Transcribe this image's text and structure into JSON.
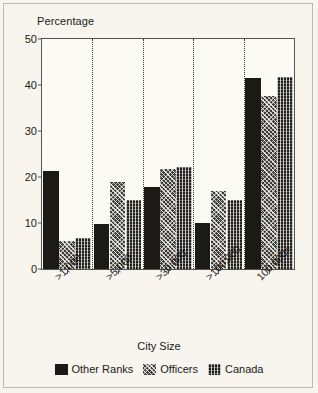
{
  "chart_data": {
    "type": "bar",
    "title": "",
    "ylabel": "Percentage",
    "xlabel": "City Size",
    "categories": [
      ">1,000",
      ">5,000",
      ">30,000",
      ">100,000",
      "100,000+"
    ],
    "series": [
      {
        "name": "Other Ranks",
        "values": [
          21.2,
          9.8,
          17.8,
          10.0,
          41.5
        ],
        "swatch": "solid-black"
      },
      {
        "name": "Officers",
        "values": [
          6.0,
          19.0,
          21.7,
          17.0,
          37.6
        ],
        "swatch": "diagonal-crosshatch"
      },
      {
        "name": "Canada",
        "values": [
          6.7,
          15.0,
          22.2,
          15.0,
          41.7
        ],
        "swatch": "fine-grid"
      }
    ],
    "ylim": [
      0,
      50
    ],
    "yticks": [
      0,
      10,
      20,
      30,
      40,
      50
    ],
    "ytick_labels": [
      "0",
      "10",
      "20",
      "30",
      "40",
      "50"
    ],
    "grid": false,
    "group_separators": "dotted-vertical",
    "legend_position": "bottom-center"
  },
  "colors": {
    "background": "#f7f5ee",
    "plot_background": "#fbfaf4",
    "axis": "#55534c",
    "text": "#1a1a18",
    "other_ranks": "#1b1a17",
    "officers": "#3c3a34",
    "canada": "#201f1b"
  }
}
